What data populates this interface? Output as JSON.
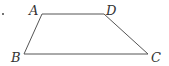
{
  "figure": {
    "type": "trapezoid",
    "stroke_color": "#555555",
    "label_color": "#333333",
    "vertices": {
      "A": {
        "label": "A",
        "x": 42,
        "y": 14,
        "lx": 29,
        "ly": 15
      },
      "D": {
        "label": "D",
        "x": 104,
        "y": 14,
        "lx": 106,
        "ly": 15
      },
      "B": {
        "label": "B",
        "x": 24,
        "y": 54,
        "lx": 11,
        "ly": 62
      },
      "C": {
        "label": "C",
        "x": 148,
        "y": 54,
        "lx": 151,
        "ly": 62
      }
    },
    "edges": [
      "AD",
      "DC",
      "CB",
      "BA"
    ],
    "marker": "•"
  }
}
